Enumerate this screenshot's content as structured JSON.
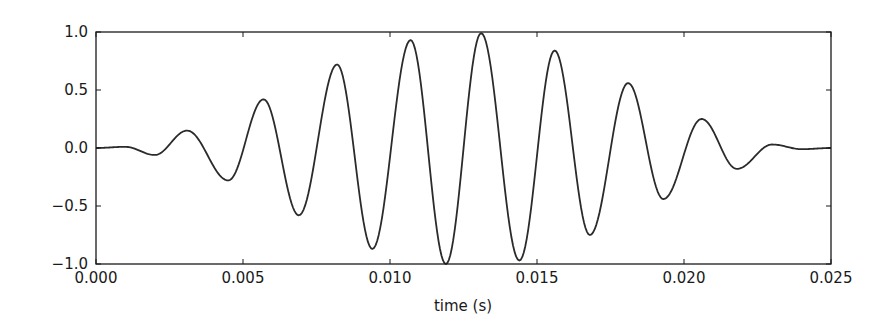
{
  "chart_data": {
    "type": "line",
    "title": "",
    "xlabel": "time (s)",
    "ylabel": "",
    "xlim": [
      0.0,
      0.025
    ],
    "ylim": [
      -1.0,
      1.0
    ],
    "grid": false,
    "legend": null,
    "x_ticks": [
      "0.000",
      "0.005",
      "0.010",
      "0.015",
      "0.020",
      "0.025"
    ],
    "y_ticks": [
      "1.0",
      "0.5",
      "0.0",
      "−0.5",
      "−1.0"
    ],
    "line_color": "#2b2b2b",
    "signal_model": {
      "description": "Gaussian-windowed sinusoid (wavelet)",
      "center_s": 0.0125,
      "frequency_hz": 408,
      "sigma_s": 0.0062,
      "phase_rad": -1.2566
    },
    "series": [
      {
        "name": "signal",
        "extrema": [
          {
            "t": 0.0,
            "y": 0.0
          },
          {
            "t": 0.001,
            "y": 0.01
          },
          {
            "t": 0.002,
            "y": -0.06
          },
          {
            "t": 0.0031,
            "y": 0.15
          },
          {
            "t": 0.0045,
            "y": -0.28
          },
          {
            "t": 0.0057,
            "y": 0.42
          },
          {
            "t": 0.0069,
            "y": -0.58
          },
          {
            "t": 0.0082,
            "y": 0.72
          },
          {
            "t": 0.0094,
            "y": -0.87
          },
          {
            "t": 0.0107,
            "y": 0.93
          },
          {
            "t": 0.0119,
            "y": -1.0
          },
          {
            "t": 0.0131,
            "y": 0.99
          },
          {
            "t": 0.0144,
            "y": -0.97
          },
          {
            "t": 0.0156,
            "y": 0.84
          },
          {
            "t": 0.0168,
            "y": -0.75
          },
          {
            "t": 0.0181,
            "y": 0.56
          },
          {
            "t": 0.0193,
            "y": -0.44
          },
          {
            "t": 0.0206,
            "y": 0.25
          },
          {
            "t": 0.0218,
            "y": -0.18
          },
          {
            "t": 0.023,
            "y": 0.03
          },
          {
            "t": 0.024,
            "y": -0.01
          },
          {
            "t": 0.025,
            "y": 0.0
          }
        ]
      }
    ]
  }
}
